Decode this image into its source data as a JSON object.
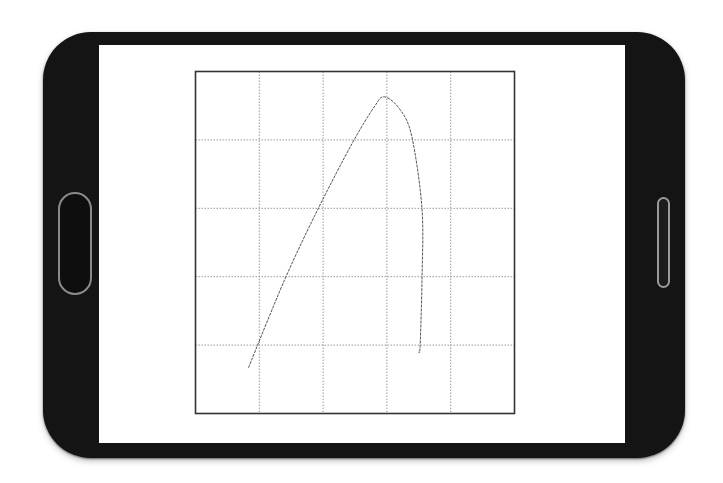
{
  "device": {
    "type": "smartphone-landscape",
    "body_color": "#141414",
    "screen_color": "#ffffff",
    "home_button_icon": "rounded-rect-button",
    "speaker_icon": "slot"
  },
  "chart_data": {
    "type": "line",
    "title": "",
    "xlabel": "",
    "ylabel": "",
    "grid": true,
    "grid_style": "dotted",
    "grid_columns": 5,
    "grid_rows": 5,
    "xlim": [
      0,
      5
    ],
    "ylim": [
      0,
      5
    ],
    "tick_labels": "none",
    "legend": "none",
    "series": [
      {
        "name": "curve",
        "color": "#555555",
        "x": [
          0.83,
          1.4,
          1.92,
          2.45,
          2.8,
          2.96,
          3.2,
          3.39,
          3.55,
          3.55,
          3.52,
          3.5
        ],
        "y": [
          0.67,
          1.96,
          2.99,
          3.94,
          4.48,
          4.63,
          4.45,
          4.05,
          2.99,
          1.96,
          0.99,
          0.9
        ]
      }
    ]
  }
}
